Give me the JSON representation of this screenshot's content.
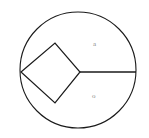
{
  "figure": {
    "type": "geometry-diagram",
    "background_color": "#ffffff",
    "stroke_color": "#1a1a1a",
    "stroke_width": 1.1,
    "circle": {
      "name": "outer-circle",
      "center_x": 78,
      "center_y": 70,
      "radius": 58,
      "fill": "none"
    },
    "square": {
      "name": "inscribed-diamond",
      "points": "21,72 55,43 80,72 55,103",
      "vertices": [
        {
          "label": "left-vertex",
          "x": 21,
          "y": 72
        },
        {
          "label": "top-vertex",
          "x": 55,
          "y": 43
        },
        {
          "label": "right-vertex",
          "x": 80,
          "y": 72
        },
        {
          "label": "bottom-vertex",
          "x": 55,
          "y": 103
        }
      ],
      "fill": "none"
    },
    "radius_line": {
      "name": "radius-segment",
      "x1": 80,
      "y1": 72,
      "x2": 136,
      "y2": 72
    },
    "labels": [
      {
        "id": "label-a",
        "text": "a",
        "x": 93,
        "y": 41,
        "color": "#8a8a8a"
      },
      {
        "id": "label-o",
        "text": "o",
        "x": 92,
        "y": 93,
        "color": "#8a8a8a"
      }
    ]
  }
}
